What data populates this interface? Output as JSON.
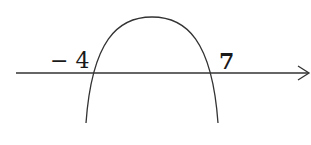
{
  "diagram": {
    "type": "sign-chart-parabola",
    "roots": [
      {
        "label": "− 4",
        "value": -4
      },
      {
        "label": "7",
        "value": 7
      }
    ],
    "axis": {
      "direction": "right-arrow"
    },
    "colors": {
      "stroke": "#333333",
      "text": "#1a1a1a",
      "background": "#ffffff"
    }
  }
}
